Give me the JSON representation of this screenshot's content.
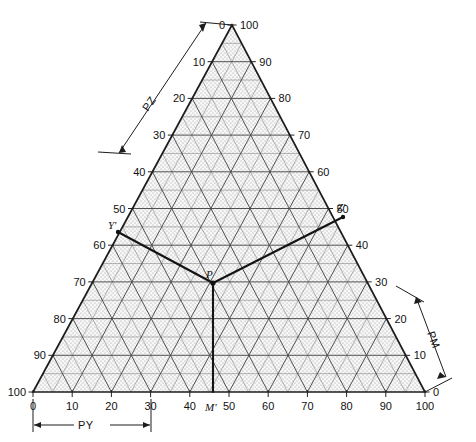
{
  "figure": {
    "type": "ternary-diagram",
    "title": "",
    "background_color": "#ffffff",
    "line_color": "#2a2a2a",
    "grid_color": "#6e6e6e",
    "fill_color": "#f2f2f2"
  },
  "chart_data": {
    "type": "scatter",
    "title": "",
    "xlabel": "",
    "ylabel": "",
    "grid": true,
    "legend_position": "none",
    "ternary": {
      "apex_top": {
        "x": 232,
        "y": 25
      },
      "apex_left": {
        "x": 33,
        "y": 392
      },
      "apex_right": {
        "x": 425,
        "y": 392
      },
      "tick_step": 10,
      "minor_step": 5,
      "range": [
        0,
        100
      ]
    },
    "axes": [
      {
        "name": "left-axis",
        "labels_top_to_bottom": [
          "0",
          "10",
          "20",
          "30",
          "40",
          "50",
          "60",
          "70",
          "80",
          "90",
          "100"
        ]
      },
      {
        "name": "right-axis",
        "labels_top_to_bottom": [
          "100",
          "90",
          "80",
          "70",
          "60",
          "50",
          "40",
          "30",
          "20",
          "10",
          "0"
        ]
      },
      {
        "name": "bottom-axis",
        "labels_left_to_right": [
          "0",
          "10",
          "20",
          "30",
          "40",
          "50",
          "60",
          "70",
          "80",
          "90",
          "100"
        ]
      }
    ],
    "points": [
      {
        "label": "P",
        "x": 213,
        "y": 283
      },
      {
        "label": "M'",
        "x": 213,
        "y": 392
      },
      {
        "label": "Y'",
        "x": 118,
        "y": 232
      },
      {
        "label": "Z'",
        "x": 343,
        "y": 217
      }
    ],
    "connector_lines": [
      {
        "from": "P",
        "to": "M'"
      },
      {
        "from": "P",
        "to": "Y'"
      },
      {
        "from": "P",
        "to": "Z'"
      }
    ],
    "dimensions": [
      {
        "label": "PZ",
        "orientation": "upper-left"
      },
      {
        "label": "PM",
        "orientation": "lower-right"
      },
      {
        "label": "PY",
        "orientation": "bottom"
      }
    ]
  }
}
